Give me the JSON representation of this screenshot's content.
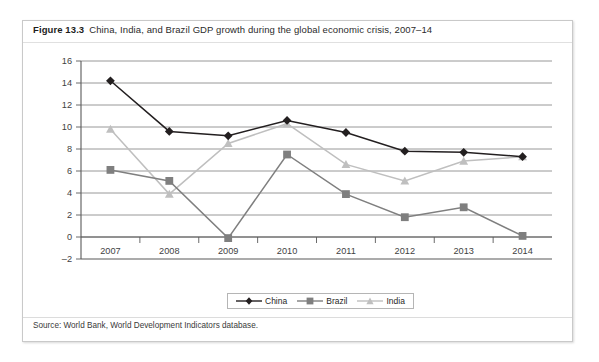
{
  "figure": {
    "number": "Figure 13.3",
    "caption": "China, India, and Brazil GDP growth during the global economic crisis, 2007–14",
    "source": "Source:  World Bank, World Development Indicators database."
  },
  "chart_data": {
    "type": "line",
    "title": "China, India, and Brazil GDP growth during the global economic crisis, 2007–14",
    "xlabel": "",
    "ylabel": "",
    "categories": [
      "2007",
      "2008",
      "2009",
      "2010",
      "2011",
      "2012",
      "2013",
      "2014"
    ],
    "x": [
      2007,
      2008,
      2009,
      2010,
      2011,
      2012,
      2013,
      2014
    ],
    "ylim": [
      -2,
      16
    ],
    "ytick_step": 2,
    "yticks": [
      "16",
      "14",
      "12",
      "10",
      "8",
      "6",
      "4",
      "2",
      "0",
      "-2"
    ],
    "grid": "horizontal",
    "legend_position": "bottom-center",
    "series": [
      {
        "name": "China",
        "color": "#231f20",
        "marker": "diamond",
        "values": [
          14.2,
          9.6,
          9.2,
          10.6,
          9.5,
          7.8,
          7.7,
          7.3
        ]
      },
      {
        "name": "Brazil",
        "color": "#7f7f7f",
        "marker": "square",
        "values": [
          6.1,
          5.1,
          -0.1,
          7.5,
          3.9,
          1.8,
          2.7,
          0.1
        ]
      },
      {
        "name": "India",
        "color": "#bfbfbf",
        "marker": "triangle",
        "values": [
          9.8,
          3.9,
          8.5,
          10.3,
          6.6,
          5.1,
          6.9,
          7.3
        ]
      }
    ]
  },
  "colors": {
    "china": "#231f20",
    "brazil": "#7f7f7f",
    "india": "#bfbfbf",
    "axis": "#595959",
    "gridline": "#8c8c8c",
    "frame_border": "#c9c9c9"
  }
}
